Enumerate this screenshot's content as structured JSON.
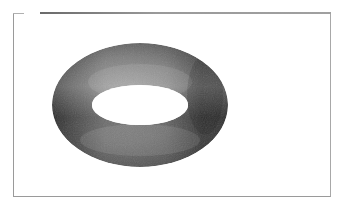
{
  "figure": {
    "colors": {
      "background": "#ffffff",
      "frame": "#9a9a9a",
      "torus_dark": "#2e2e2e",
      "torus_mid": "#6e6e6e",
      "torus_light": "#9c9c9c"
    },
    "torus": {
      "outer_ellipse": {
        "cx": 140,
        "cy": 105,
        "rx": 88,
        "ry": 62
      },
      "inner_hole": {
        "cx": 140,
        "cy": 105,
        "rx": 48,
        "ry": 20
      }
    }
  }
}
